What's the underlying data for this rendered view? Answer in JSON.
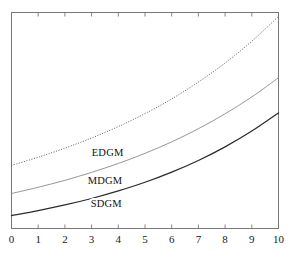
{
  "chart_data": {
    "type": "line",
    "title": "",
    "subtitle": "",
    "xlabel": "",
    "ylabel": "",
    "xlim": [
      0,
      10
    ],
    "ylim": [
      0,
      1
    ],
    "grid": false,
    "legend": "inline-labels",
    "xticks": [
      "0",
      "1",
      "2",
      "3",
      "4",
      "5",
      "6",
      "7",
      "8",
      "9",
      "10"
    ],
    "yticks": [],
    "x": [
      0,
      1,
      2,
      3,
      4,
      5,
      6,
      7,
      8,
      9,
      10
    ],
    "series": [
      {
        "name": "EDGM",
        "style": "dotted",
        "color": "#4a4a4a",
        "width": 0.9,
        "label_x": 3.6,
        "label_y": 0.335,
        "values": [
          0.292,
          0.33,
          0.372,
          0.419,
          0.472,
          0.532,
          0.6,
          0.678,
          0.766,
          0.867,
          0.982
        ]
      },
      {
        "name": "MDGM",
        "style": "solid",
        "color": "#8a8a8a",
        "width": 0.9,
        "label_x": 3.5,
        "label_y": 0.205,
        "values": [
          0.162,
          0.191,
          0.223,
          0.26,
          0.301,
          0.348,
          0.401,
          0.462,
          0.531,
          0.609,
          0.698
        ]
      },
      {
        "name": "SDGM",
        "style": "solid",
        "color": "#2b2b2b",
        "width": 1.25,
        "label_x": 3.55,
        "label_y": 0.098,
        "values": [
          0.06,
          0.083,
          0.109,
          0.139,
          0.174,
          0.214,
          0.261,
          0.315,
          0.378,
          0.451,
          0.535
        ]
      }
    ],
    "frame": {
      "color": "#777777",
      "width": 1,
      "ticks_bottom": true,
      "ticks_top": true,
      "ticks_left": false,
      "ticks_right": false
    }
  }
}
